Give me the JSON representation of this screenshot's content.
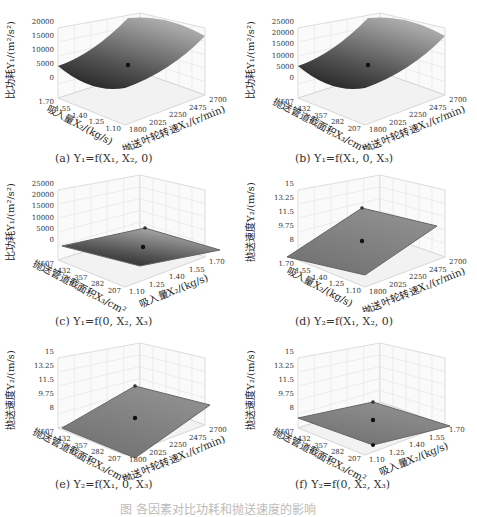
{
  "figure": {
    "main_caption": "图 各因素对比功耗和抛送速度的影响"
  },
  "panels": [
    {
      "id": "a",
      "caption": "(a) Y₁=f(X₁, X₂, 0)",
      "zlabel": "比功耗Y₁/(m²/s²)",
      "xlabel": "吸入量X₂/(kg/s)",
      "ylabel": "抛送叶轮转速X₁/(r/min)"
    },
    {
      "id": "b",
      "caption": "(b) Y₁=f(X₁, 0, X₃)",
      "zlabel": "比功耗Y₁/(m²/s²)",
      "xlabel": "抛送管道截面积X₃/cm²",
      "ylabel": "抛送叶轮转速X₁/(r/min)"
    },
    {
      "id": "c",
      "caption": "(c) Y₁=f(0, X₂, X₃)",
      "zlabel": "比功耗Y₁/(m²/s²)",
      "xlabel": "抛送管道截面积X₃/cm²",
      "ylabel": "吸入量X₂/(kg/s)"
    },
    {
      "id": "d",
      "caption": "(d) Y₂=f(X₁, X₂, 0)",
      "zlabel": "抛送速度Y₂/(m/s)",
      "xlabel": "吸入量X₂/(kg/s)",
      "ylabel": "抛送叶轮转速X₁/(r/min)"
    },
    {
      "id": "e",
      "caption": "(e) Y₂=f(X₁, 0, X₃)",
      "zlabel": "抛送速度Y₂/(m/s)",
      "xlabel": "抛送管道截面积X₃/cm²",
      "ylabel": "抛送叶轮转速X₁/(r/min)"
    },
    {
      "id": "f",
      "caption": "(f) Y₂=f(0, X₂, X₃)",
      "zlabel": "抛送速度Y₂/(m/s)",
      "xlabel": "抛送管道截面积X₃/cm²",
      "ylabel": "吸入量X₂/(kg/s)"
    }
  ],
  "chart_data": [
    {
      "type": "surface3d",
      "title": "(a) Y₁=f(X₁, X₂, 0)",
      "zlabel": "比功耗Y₁/(m²/s²)",
      "x_axis": {
        "label": "吸入量X₂/(kg/s)",
        "ticks": [
          "1.10",
          "1.25",
          "1.40",
          "1.55",
          "1.70"
        ]
      },
      "y_axis": {
        "label": "抛送叶轮转速X₁/(r/min)",
        "ticks": [
          "1800",
          "2025",
          "2250",
          "2475",
          "2700"
        ]
      },
      "z_axis": {
        "ticks": [
          "0",
          "5000",
          "10000",
          "15000",
          "20000"
        ],
        "range": [
          0,
          20000
        ]
      },
      "corner_values": {
        "min": 2000,
        "max": 19000
      },
      "center_point": 6000
    },
    {
      "type": "surface3d",
      "title": "(b) Y₁=f(X₁, 0, X₃)",
      "zlabel": "比功耗Y₁/(m²/s²)",
      "x_axis": {
        "label": "抛送管道截面积X₃/cm²",
        "ticks": [
          "207",
          "282",
          "357",
          "432",
          "507"
        ]
      },
      "y_axis": {
        "label": "抛送叶轮转速X₁/(r/min)",
        "ticks": [
          "1800",
          "2025",
          "2250",
          "2475",
          "2700"
        ]
      },
      "z_axis": {
        "ticks": [
          "0",
          "5000",
          "10000",
          "15000",
          "20000",
          "25000"
        ],
        "range": [
          0,
          25000
        ]
      },
      "corner_values": {
        "min": 1000,
        "max": 24000
      },
      "center_point": 6000
    },
    {
      "type": "surface3d",
      "title": "(c) Y₁=f(0, X₂, X₃)",
      "zlabel": "比功耗Y₁/(m²/s²)",
      "x_axis": {
        "label": "抛送管道截面积X₃/cm²",
        "ticks": [
          "207",
          "282",
          "357",
          "432",
          "507"
        ]
      },
      "y_axis": {
        "label": "吸入量X₂/(kg/s)",
        "ticks": [
          "1.10",
          "1.25",
          "1.40",
          "1.55",
          "1.70"
        ]
      },
      "z_axis": {
        "ticks": [
          "0",
          "5000",
          "10000",
          "15000",
          "20000",
          "25000"
        ],
        "range": [
          0,
          25000
        ]
      },
      "corner_values": {
        "min": 0,
        "max": 12000
      },
      "center_point": 6000
    },
    {
      "type": "surface3d",
      "title": "(d) Y₂=f(X₁, X₂, 0)",
      "zlabel": "抛送速度Y₂/(m/s)",
      "x_axis": {
        "label": "吸入量X₂/(kg/s)",
        "ticks": [
          "1.10",
          "1.25",
          "1.40",
          "1.55",
          "1.70"
        ]
      },
      "y_axis": {
        "label": "抛送叶轮转速X₁/(r/min)",
        "ticks": [
          "1800",
          "2025",
          "2250",
          "2475",
          "2700"
        ]
      },
      "z_axis": {
        "ticks": [
          "8",
          "9.75",
          "11.5",
          "13.25",
          "15"
        ],
        "range": [
          8,
          15
        ]
      },
      "corner_values": {
        "min": 8,
        "max": 15
      },
      "center_point": 11.5
    },
    {
      "type": "surface3d",
      "title": "(e) Y₂=f(X₁, 0, X₃)",
      "zlabel": "抛送速度Y₂/(m/s)",
      "x_axis": {
        "label": "抛送管道截面积X₃/cm²",
        "ticks": [
          "207",
          "282",
          "357",
          "432",
          "507"
        ]
      },
      "y_axis": {
        "label": "抛送叶轮转速X₁/(r/min)",
        "ticks": [
          "1800",
          "2025",
          "2250",
          "2475",
          "2700"
        ]
      },
      "z_axis": {
        "ticks": [
          "8",
          "9.75",
          "11.5",
          "13.25",
          "15"
        ],
        "range": [
          8,
          15
        ]
      },
      "corner_values": {
        "min": 7.5,
        "max": 15.5
      },
      "center_point": 11.5
    },
    {
      "type": "surface3d",
      "title": "(f) Y₂=f(0, X₂, X₃)",
      "zlabel": "抛送速度Y₂/(m/s)",
      "x_axis": {
        "label": "抛送管道截面积X₃/cm²",
        "ticks": [
          "207",
          "282",
          "357",
          "432",
          "507"
        ]
      },
      "y_axis": {
        "label": "吸入量X₂/(kg/s)",
        "ticks": [
          "1.10",
          "1.25",
          "1.40",
          "1.55",
          "1.70"
        ]
      },
      "z_axis": {
        "ticks": [
          "8",
          "9.75",
          "11.5",
          "13.25",
          "15"
        ],
        "range": [
          8,
          15
        ]
      },
      "corner_values": {
        "min": 10.5,
        "max": 12.5
      },
      "center_point": 11.5
    }
  ]
}
